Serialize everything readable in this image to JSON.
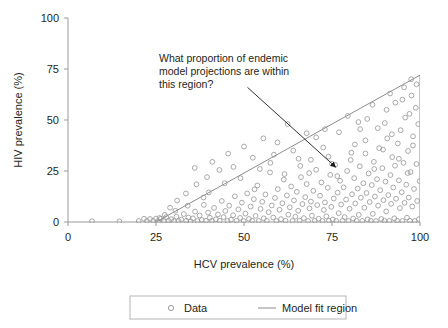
{
  "chart_data": {
    "type": "scatter",
    "title": "",
    "xlabel": "HCV prevalence (%)",
    "ylabel": "HIV prevalence (%)",
    "xlim": [
      0,
      100
    ],
    "ylim": [
      0,
      100
    ],
    "xticks": [
      "0",
      "25",
      "50",
      "75",
      "100"
    ],
    "xtick_values": [
      0,
      25,
      50,
      75,
      100
    ],
    "yticks": [
      "0",
      "25",
      "50",
      "75",
      "100"
    ],
    "ytick_values": [
      0,
      25,
      50,
      75,
      100
    ],
    "grid": false,
    "legend_position": "bottom",
    "legend": [
      {
        "label": "Data",
        "marker": "open-circle",
        "color": "#9a9a9a"
      },
      {
        "label": "Model fit region",
        "marker": "line",
        "color": "#8c8c8c"
      }
    ],
    "annotations": [
      {
        "text_lines": [
          "What proportion of endemic",
          "model projections are within",
          "this region?"
        ],
        "arrow_from": [
          51,
          66
        ],
        "arrow_to": [
          76,
          27
        ]
      }
    ],
    "model_fit_region": {
      "label": "Model fit region",
      "type": "triangle",
      "vertices": [
        [
          25,
          0
        ],
        [
          100,
          0
        ],
        [
          100,
          72
        ]
      ],
      "color": "#8c8c8c"
    },
    "series": [
      {
        "name": "Data",
        "marker": "open-circle",
        "color": "#9a9a9a",
        "points": [
          [
            6.8,
            0.4
          ],
          [
            14.6,
            0.3
          ],
          [
            20.1,
            0.5
          ],
          [
            21.6,
            1.6
          ],
          [
            22.4,
            0.5
          ],
          [
            23.3,
            1.5
          ],
          [
            24.2,
            0.6
          ],
          [
            25.0,
            1.7
          ],
          [
            25.6,
            0.4
          ],
          [
            26.4,
            1.6
          ],
          [
            27.2,
            0.5
          ],
          [
            27.9,
            2.4
          ],
          [
            28.6,
            0.6
          ],
          [
            29.3,
            1.4
          ],
          [
            30.1,
            0.4
          ],
          [
            30.8,
            2.6
          ],
          [
            31.4,
            0.5
          ],
          [
            32.2,
            1.2
          ],
          [
            32.9,
            3.9
          ],
          [
            33.6,
            0.6
          ],
          [
            34.2,
            2.2
          ],
          [
            34.8,
            0.4
          ],
          [
            35.5,
            1.8
          ],
          [
            36.1,
            5.1
          ],
          [
            36.8,
            0.5
          ],
          [
            37.4,
            3.2
          ],
          [
            38.0,
            1.0
          ],
          [
            38.6,
            8.4
          ],
          [
            39.2,
            0.6
          ],
          [
            39.8,
            4.6
          ],
          [
            40.3,
            2.1
          ],
          [
            40.9,
            0.5
          ],
          [
            41.5,
            6.9
          ],
          [
            42.0,
            1.3
          ],
          [
            42.6,
            3.7
          ],
          [
            43.1,
            0.6
          ],
          [
            43.7,
            10.3
          ],
          [
            44.2,
            2.4
          ],
          [
            44.7,
            5.4
          ],
          [
            45.3,
            0.5
          ],
          [
            45.8,
            8.0
          ],
          [
            46.3,
            1.1
          ],
          [
            46.9,
            3.3
          ],
          [
            47.4,
            12.6
          ],
          [
            47.9,
            0.6
          ],
          [
            48.4,
            6.2
          ],
          [
            48.9,
            2.0
          ],
          [
            49.4,
            9.5
          ],
          [
            49.9,
            0.5
          ],
          [
            50.4,
            4.1
          ],
          [
            50.9,
            14.0
          ],
          [
            51.4,
            1.5
          ],
          [
            51.9,
            7.6
          ],
          [
            52.3,
            0.6
          ],
          [
            52.8,
            11.2
          ],
          [
            53.3,
            3.0
          ],
          [
            53.8,
            17.9
          ],
          [
            54.2,
            0.5
          ],
          [
            54.7,
            6.4
          ],
          [
            55.2,
            9.9
          ],
          [
            55.6,
            1.8
          ],
          [
            56.1,
            13.5
          ],
          [
            56.5,
            0.6
          ],
          [
            57.0,
            4.8
          ],
          [
            57.4,
            24.3
          ],
          [
            57.9,
            8.1
          ],
          [
            58.3,
            2.2
          ],
          [
            58.8,
            11.8
          ],
          [
            59.2,
            0.5
          ],
          [
            59.6,
            16.1
          ],
          [
            60.1,
            6.0
          ],
          [
            60.5,
            1.4
          ],
          [
            60.9,
            9.2
          ],
          [
            61.3,
            20.8
          ],
          [
            61.8,
            0.6
          ],
          [
            62.2,
            13.0
          ],
          [
            62.6,
            3.6
          ],
          [
            63.0,
            7.2
          ],
          [
            63.4,
            17.4
          ],
          [
            63.8,
            0.5
          ],
          [
            64.2,
            10.6
          ],
          [
            64.6,
            2.6
          ],
          [
            65.0,
            14.8
          ],
          [
            65.4,
            5.5
          ],
          [
            65.8,
            0.6
          ],
          [
            66.2,
            22.0
          ],
          [
            66.6,
            8.8
          ],
          [
            67.0,
            1.9
          ],
          [
            67.4,
            12.2
          ],
          [
            67.8,
            18.6
          ],
          [
            68.2,
            0.5
          ],
          [
            68.6,
            6.7
          ],
          [
            69.0,
            10.0
          ],
          [
            69.3,
            3.1
          ],
          [
            69.7,
            15.3
          ],
          [
            70.1,
            0.6
          ],
          [
            70.5,
            25.6
          ],
          [
            70.8,
            8.3
          ],
          [
            71.2,
            1.6
          ],
          [
            71.6,
            12.9
          ],
          [
            72.0,
            19.4
          ],
          [
            72.3,
            0.5
          ],
          [
            72.7,
            5.9
          ],
          [
            73.0,
            9.6
          ],
          [
            73.4,
            2.8
          ],
          [
            73.8,
            16.8
          ],
          [
            74.1,
            0.6
          ],
          [
            74.5,
            23.1
          ],
          [
            74.8,
            7.4
          ],
          [
            75.2,
            1.2
          ],
          [
            75.5,
            11.5
          ],
          [
            75.9,
            28.0
          ],
          [
            76.2,
            0.5
          ],
          [
            76.6,
            14.4
          ],
          [
            76.9,
            4.3
          ],
          [
            77.3,
            20.2
          ],
          [
            77.6,
            8.6
          ],
          [
            78.0,
            0.6
          ],
          [
            78.3,
            17.0
          ],
          [
            78.6,
            2.4
          ],
          [
            79.0,
            11.0
          ],
          [
            79.3,
            25.0
          ],
          [
            79.7,
            0.5
          ],
          [
            80.0,
            6.5
          ],
          [
            80.3,
            30.4
          ],
          [
            80.7,
            13.6
          ],
          [
            81.0,
            1.7
          ],
          [
            81.3,
            21.5
          ],
          [
            81.6,
            9.1
          ],
          [
            82.0,
            0.6
          ],
          [
            82.3,
            16.4
          ],
          [
            82.6,
            3.5
          ],
          [
            82.9,
            27.3
          ],
          [
            83.2,
            11.9
          ],
          [
            83.6,
            0.5
          ],
          [
            83.9,
            19.0
          ],
          [
            84.2,
            7.0
          ],
          [
            84.5,
            33.6
          ],
          [
            84.8,
            14.2
          ],
          [
            85.1,
            1.3
          ],
          [
            85.4,
            23.8
          ],
          [
            85.7,
            9.8
          ],
          [
            86.0,
            0.6
          ],
          [
            86.3,
            18.1
          ],
          [
            86.6,
            4.0
          ],
          [
            86.9,
            29.5
          ],
          [
            87.2,
            12.5
          ],
          [
            87.5,
            0.5
          ],
          [
            87.8,
            21.0
          ],
          [
            88.1,
            8.0
          ],
          [
            88.4,
            36.2
          ],
          [
            88.7,
            15.6
          ],
          [
            89.0,
            1.5
          ],
          [
            89.3,
            26.4
          ],
          [
            89.6,
            10.7
          ],
          [
            89.9,
            0.6
          ],
          [
            90.2,
            19.8
          ],
          [
            90.4,
            5.2
          ],
          [
            90.7,
            41.0
          ],
          [
            91.0,
            13.2
          ],
          [
            91.3,
            0.5
          ],
          [
            91.6,
            23.0
          ],
          [
            91.8,
            8.9
          ],
          [
            92.1,
            31.8
          ],
          [
            92.4,
            16.9
          ],
          [
            92.7,
            1.8
          ],
          [
            92.9,
            27.6
          ],
          [
            93.2,
            11.4
          ],
          [
            93.5,
            0.6
          ],
          [
            93.7,
            38.5
          ],
          [
            94.0,
            20.4
          ],
          [
            94.3,
            6.8
          ],
          [
            94.5,
            45.0
          ],
          [
            94.8,
            14.6
          ],
          [
            95.0,
            0.5
          ],
          [
            95.3,
            29.0
          ],
          [
            95.6,
            9.4
          ],
          [
            95.8,
            51.2
          ],
          [
            96.1,
            18.3
          ],
          [
            96.3,
            2.1
          ],
          [
            96.6,
            34.8
          ],
          [
            96.8,
            12.0
          ],
          [
            97.1,
            0.6
          ],
          [
            97.3,
            24.5
          ],
          [
            97.6,
            62.0
          ],
          [
            97.8,
            7.6
          ],
          [
            98.0,
            42.0
          ],
          [
            98.3,
            16.2
          ],
          [
            98.5,
            0.5
          ],
          [
            98.8,
            56.0
          ],
          [
            99.0,
            28.4
          ],
          [
            99.2,
            10.3
          ],
          [
            99.5,
            48.0
          ],
          [
            99.7,
            1.4
          ],
          [
            99.9,
            20.0
          ],
          [
            55.5,
            41.0
          ],
          [
            62.4,
            48.0
          ],
          [
            67.8,
            43.5
          ],
          [
            72.5,
            36.5
          ],
          [
            77.0,
            44.0
          ],
          [
            81.5,
            38.0
          ],
          [
            85.0,
            50.5
          ],
          [
            88.0,
            46.0
          ],
          [
            90.5,
            55.0
          ],
          [
            93.0,
            58.5
          ],
          [
            95.5,
            66.0
          ],
          [
            97.0,
            53.0
          ],
          [
            91.5,
            63.0
          ],
          [
            86.5,
            57.5
          ],
          [
            83.0,
            45.5
          ],
          [
            79.5,
            52.0
          ],
          [
            74.0,
            32.0
          ],
          [
            69.0,
            30.5
          ],
          [
            64.0,
            35.0
          ],
          [
            58.5,
            33.0
          ],
          [
            52.5,
            31.5
          ],
          [
            47.0,
            27.0
          ],
          [
            43.0,
            25.5
          ],
          [
            39.5,
            22.0
          ],
          [
            36.5,
            18.5
          ],
          [
            33.5,
            14.0
          ],
          [
            31.0,
            10.5
          ],
          [
            29.0,
            7.0
          ],
          [
            41.0,
            29.5
          ],
          [
            45.5,
            33.5
          ],
          [
            50.0,
            37.0
          ],
          [
            54.5,
            26.0
          ],
          [
            59.5,
            39.0
          ],
          [
            66.0,
            27.5
          ],
          [
            70.5,
            41.5
          ],
          [
            75.0,
            28.5
          ],
          [
            80.5,
            34.0
          ],
          [
            84.5,
            40.0
          ],
          [
            89.5,
            35.5
          ],
          [
            94.0,
            31.0
          ],
          [
            98.0,
            37.5
          ],
          [
            36.0,
            26.5
          ],
          [
            40.0,
            14.5
          ],
          [
            44.5,
            19.0
          ],
          [
            49.0,
            21.5
          ],
          [
            53.0,
            16.0
          ],
          [
            57.5,
            29.0
          ],
          [
            61.5,
            23.5
          ],
          [
            65.5,
            31.0
          ],
          [
            68.5,
            24.0
          ],
          [
            73.0,
            45.5
          ],
          [
            76.5,
            22.5
          ],
          [
            82.5,
            49.0
          ],
          [
            87.0,
            26.0
          ],
          [
            92.0,
            43.0
          ],
          [
            96.5,
            24.0
          ],
          [
            38.5,
            12.0
          ],
          [
            34.0,
            8.0
          ],
          [
            30.5,
            5.5
          ],
          [
            27.5,
            3.5
          ],
          [
            26.0,
            2.0
          ],
          [
            99.0,
            67.5
          ],
          [
            97.5,
            70.0
          ],
          [
            95.0,
            60.0
          ],
          [
            90.0,
            48.5
          ]
        ]
      }
    ]
  },
  "axis": {
    "x_label": "HCV prevalence (%)",
    "y_label": "HIV prevalence (%)"
  }
}
